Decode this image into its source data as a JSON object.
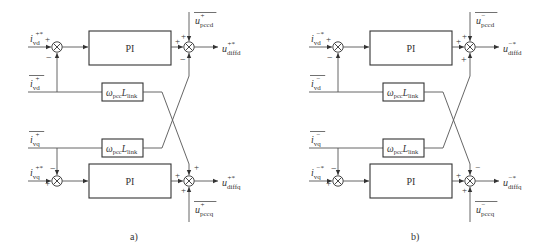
{
  "diagram": {
    "type": "control-block-diagram",
    "panels": [
      {
        "caption": "a)",
        "inputs": {
          "id_ref": {
            "sym": "i",
            "sup": "+*",
            "sub": "vd"
          },
          "id_fb": {
            "sym": "i",
            "sup": "+",
            "sub": "vd",
            "overline": true
          },
          "iq_fb": {
            "sym": "i",
            "sup": "+",
            "sub": "vq",
            "overline": true
          },
          "iq_ref": {
            "sym": "i",
            "sup": "+*",
            "sub": "vq"
          },
          "ud_ff": {
            "sym": "u",
            "sup": "+",
            "sub": "pccd",
            "overline": true
          },
          "uq_ff": {
            "sym": "u",
            "sup": "+",
            "sub": "pccq",
            "overline": true
          }
        },
        "outputs": {
          "ud_out": {
            "sym": "u",
            "sup": "+*",
            "sub": "diffd"
          },
          "uq_out": {
            "sym": "u",
            "sup": "+*",
            "sub": "diffq"
          }
        },
        "blocks": {
          "pi_top": "PI",
          "pi_bottom": "PI",
          "coupling_top": {
            "sym": "ω",
            "sub1": "pcc",
            "sym2": "L",
            "sub2": "link"
          },
          "coupling_bottom": {
            "sym": "ω",
            "sub1": "pcc",
            "sym2": "L",
            "sub2": "link"
          }
        },
        "signs": {
          "sum_left_top": {
            "ref": "+",
            "fb": "−"
          },
          "sum_left_bottom": {
            "ref": "+",
            "fb": "−"
          },
          "sum_right_top": {
            "pi": "+",
            "ff": "+",
            "cross": "−"
          },
          "sum_right_bottom": {
            "pi": "+",
            "cross": "+",
            "ff": "+"
          }
        }
      },
      {
        "caption": "b)",
        "inputs": {
          "id_ref": {
            "sym": "i",
            "sup": "−*",
            "sub": "vd"
          },
          "id_fb": {
            "sym": "i",
            "sup": "−",
            "sub": "vd",
            "overline": true
          },
          "iq_fb": {
            "sym": "i",
            "sup": "−",
            "sub": "vq",
            "overline": true
          },
          "iq_ref": {
            "sym": "i",
            "sup": "−*",
            "sub": "vq"
          },
          "ud_ff": {
            "sym": "u",
            "sup": "−",
            "sub": "pccd",
            "overline": true
          },
          "uq_ff": {
            "sym": "u",
            "sup": "−",
            "sub": "pccq",
            "overline": true
          }
        },
        "outputs": {
          "ud_out": {
            "sym": "u",
            "sup": "−*",
            "sub": "diffd"
          },
          "uq_out": {
            "sym": "u",
            "sup": "−*",
            "sub": "diffq"
          }
        },
        "blocks": {
          "pi_top": "PI",
          "pi_bottom": "PI",
          "coupling_top": {
            "sym": "ω",
            "sub1": "pcc",
            "sym2": "L",
            "sub2": "link"
          },
          "coupling_bottom": {
            "sym": "ω",
            "sub1": "pcc",
            "sym2": "L",
            "sub2": "link"
          }
        },
        "signs": {
          "sum_left_top": {
            "ref": "+",
            "fb": "−"
          },
          "sum_left_bottom": {
            "ref": "+",
            "fb": "−"
          },
          "sum_right_top": {
            "pi": "+",
            "ff": "+",
            "cross": "+"
          },
          "sum_right_bottom": {
            "pi": "+",
            "cross": "−",
            "ff": "+"
          }
        }
      }
    ]
  }
}
